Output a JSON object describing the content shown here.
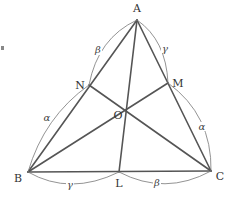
{
  "diagram": {
    "title": "",
    "vertices": {
      "A": {
        "label": "A",
        "x": 137,
        "y": 20,
        "lx": 137,
        "ly": 12
      },
      "B": {
        "label": "B",
        "x": 28,
        "y": 172,
        "lx": 18,
        "ly": 182
      },
      "C": {
        "label": "C",
        "x": 211,
        "y": 171,
        "lx": 219,
        "ly": 180
      },
      "N": {
        "label": "N",
        "x": 89,
        "y": 85,
        "lx": 79,
        "ly": 88
      },
      "M": {
        "label": "M",
        "x": 168,
        "y": 83,
        "lx": 178,
        "ly": 85
      },
      "O": {
        "label": "O",
        "x": 127,
        "y": 109,
        "lx": 118,
        "ly": 118
      },
      "L": {
        "label": "L",
        "x": 119,
        "y": 172,
        "lx": 119,
        "ly": 186
      }
    },
    "segments": [
      "AB",
      "AC",
      "BC",
      "AL",
      "BM",
      "CN"
    ],
    "arc_labels": {
      "BN": "α",
      "NA": "β",
      "AM": "γ",
      "MC": "α",
      "BL": "γ",
      "LC": "β"
    }
  }
}
